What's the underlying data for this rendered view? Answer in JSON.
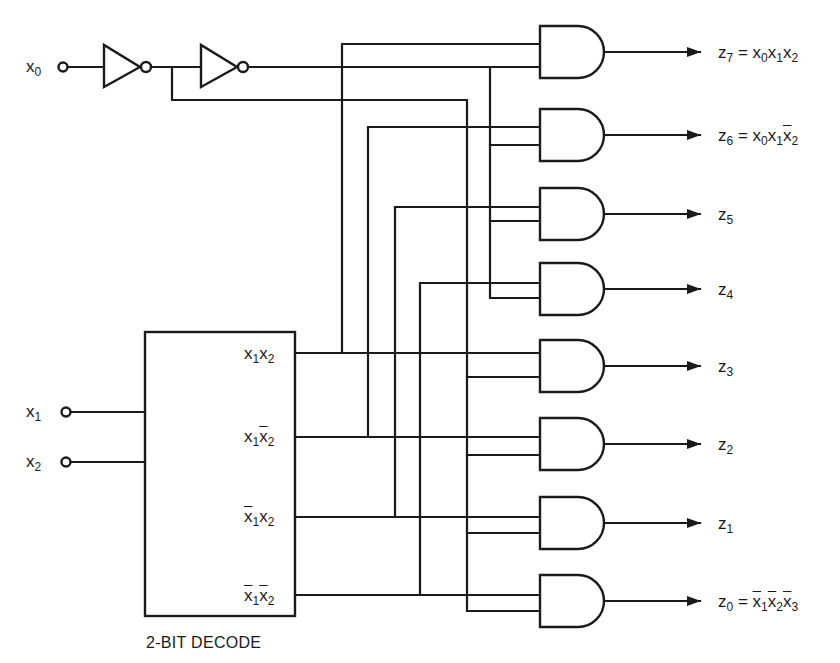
{
  "diagram": {
    "type": "logic-circuit",
    "colors": {
      "line": "#1a1a1a",
      "background": "#ffffff"
    }
  },
  "inputs": {
    "x0": {
      "var": "x",
      "sub": "0"
    },
    "x1": {
      "var": "x",
      "sub": "1"
    },
    "x2": {
      "var": "x",
      "sub": "2"
    }
  },
  "decoder": {
    "caption": "2-BIT DECODE",
    "outputs": [
      {
        "a": "x",
        "a_sub": "1",
        "a_bar": false,
        "b": "x",
        "b_sub": "2",
        "b_bar": false,
        "text": "x1x2"
      },
      {
        "a": "x",
        "a_sub": "1",
        "a_bar": false,
        "b": "x",
        "b_sub": "2",
        "b_bar": true,
        "text": "x1x̄2"
      },
      {
        "a": "x",
        "a_sub": "1",
        "a_bar": true,
        "b": "x",
        "b_sub": "2",
        "b_bar": false,
        "text": "x̄1x2"
      },
      {
        "a": "x",
        "a_sub": "1",
        "a_bar": true,
        "b": "x",
        "b_sub": "2",
        "b_bar": true,
        "text": "x̄1x̄2"
      }
    ]
  },
  "outputs": [
    {
      "name": "z",
      "sub": "7",
      "expr": "= x0x1x2"
    },
    {
      "name": "z",
      "sub": "6",
      "expr": "= x0x1x̄2"
    },
    {
      "name": "z",
      "sub": "5",
      "expr": ""
    },
    {
      "name": "z",
      "sub": "4",
      "expr": ""
    },
    {
      "name": "z",
      "sub": "3",
      "expr": ""
    },
    {
      "name": "z",
      "sub": "2",
      "expr": ""
    },
    {
      "name": "z",
      "sub": "1",
      "expr": ""
    },
    {
      "name": "z",
      "sub": "0",
      "expr": "= x̄1x̄2x̄3"
    }
  ],
  "labels": {
    "eq": "=",
    "x": "x",
    "z": "z",
    "s0": "0",
    "s1": "1",
    "s2": "2",
    "s3": "3",
    "s4": "4",
    "s5": "5",
    "s6": "6",
    "s7": "7"
  }
}
